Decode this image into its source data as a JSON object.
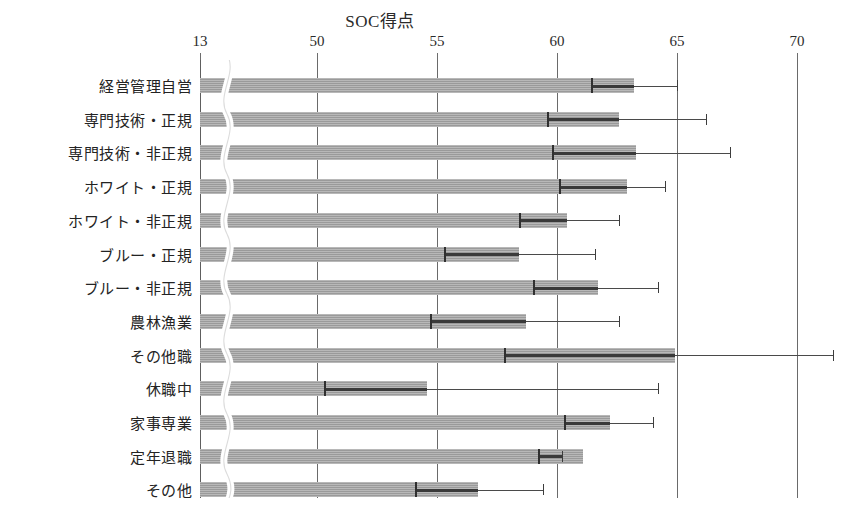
{
  "chart_data": {
    "type": "bar",
    "orientation": "horizontal",
    "title": "SOC得点",
    "xlabel": "",
    "ylabel": "",
    "xlim": [
      13,
      71.5
    ],
    "axis_break": true,
    "axis_break_note": "x軸は13で切断",
    "grid": true,
    "gridlines_on": "x",
    "legend": "none",
    "error_bar_style": "95% CI whiskers with inner dark segment",
    "xticks": [
      {
        "label": "13",
        "value": 13
      },
      {
        "label": "50",
        "value": 50
      },
      {
        "label": "55",
        "value": 55
      },
      {
        "label": "60",
        "value": 60
      },
      {
        "label": "65",
        "value": 65
      },
      {
        "label": "70",
        "value": 70
      }
    ],
    "categories": [
      "経営管理自営",
      "専門技術・正規",
      "専門技術・非正規",
      "ホワイト・正規",
      "ホワイト・非正規",
      "ブルー・正規",
      "ブルー・非正規",
      "農林漁業",
      "その他職",
      "休職中",
      "家事専業",
      "定年退職",
      "その他"
    ],
    "values": [
      63.2,
      62.6,
      63.3,
      62.9,
      60.4,
      58.4,
      61.7,
      58.7,
      64.9,
      54.6,
      62.2,
      61.1,
      56.7
    ],
    "ci_low": [
      61.4,
      59.6,
      59.8,
      60.1,
      58.4,
      55.3,
      59.0,
      54.7,
      57.8,
      50.3,
      60.3,
      59.2,
      54.1
    ],
    "ci_high": [
      65.0,
      66.2,
      67.2,
      64.5,
      62.6,
      61.6,
      64.2,
      62.6,
      71.5,
      64.2,
      64.0,
      60.2,
      59.4
    ],
    "series": [
      {
        "name": "SOC得点平均",
        "values": [
          63.2,
          62.6,
          63.3,
          62.9,
          60.4,
          58.4,
          61.7,
          58.7,
          64.9,
          54.6,
          62.2,
          61.1,
          56.7
        ]
      }
    ],
    "colors": {
      "bar_fill": "#9a9a9a",
      "error_bar": "#4a4a4a",
      "gridline": "#6a6a6a",
      "text": "#232323",
      "background": "#ffffff"
    }
  }
}
